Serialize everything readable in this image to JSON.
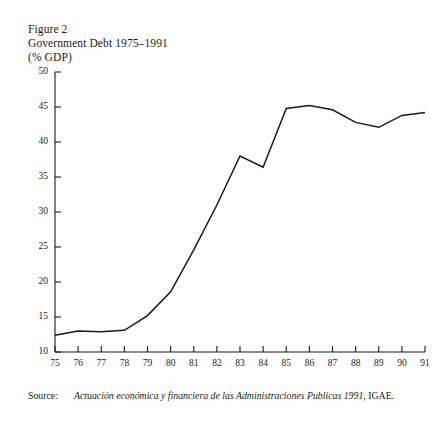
{
  "figure": {
    "figure_number": "Figure 2",
    "title": "Government Debt 1975–1991",
    "units": "(% GDP)"
  },
  "source": {
    "label": "Source:",
    "citation_italic": "Actuación económica y financiera de las Administraciones Publicas 1991",
    "citation_rest": ", IGAE."
  },
  "colors": {
    "line": "#1a1a1a",
    "axis": "#1a1a1a",
    "background": "#ffffff"
  },
  "chart_data": {
    "type": "line",
    "title": "Government Debt 1975–1991",
    "subtitle": "(% GDP)",
    "xlabel": "",
    "ylabel": "",
    "grid": false,
    "legend": null,
    "xlim": [
      1975,
      1991
    ],
    "ylim": [
      10,
      50
    ],
    "ytick_labels": [
      "10",
      "15",
      "20",
      "25",
      "30",
      "35",
      "40",
      "45",
      "50"
    ],
    "yticks": [
      10,
      15,
      20,
      25,
      30,
      35,
      40,
      45,
      50
    ],
    "xtick_labels": [
      "75",
      "76",
      "77",
      "78",
      "79",
      "80",
      "81",
      "82",
      "83",
      "84",
      "85",
      "86",
      "87",
      "88",
      "89",
      "90",
      "91"
    ],
    "x": [
      1975,
      1976,
      1977,
      1978,
      1979,
      1980,
      1981,
      1982,
      1983,
      1984,
      1985,
      1986,
      1987,
      1988,
      1989,
      1990,
      1991
    ],
    "series": [
      {
        "name": "Government Debt (% GDP)",
        "values": [
          12.4,
          13.0,
          12.9,
          13.1,
          15.2,
          18.6,
          24.6,
          31.0,
          38.0,
          36.4,
          44.8,
          45.2,
          44.6,
          42.8,
          42.1,
          43.8,
          44.2
        ]
      }
    ]
  }
}
